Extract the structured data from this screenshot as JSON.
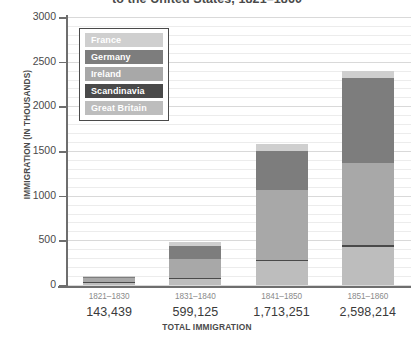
{
  "chart_data": {
    "type": "bar",
    "stacked": true,
    "title": "to the United States, 1821–1860",
    "xlabel": "TOTAL IMMIGRATION",
    "ylabel": "IMMIGRATION (IN THOUSANDS)",
    "ylim": [
      0,
      3000
    ],
    "yticks": [
      0,
      500,
      1000,
      1500,
      2000,
      2500,
      3000
    ],
    "ytick_labels": [
      "0",
      "500",
      "1000",
      "1500",
      "2000",
      "2500",
      "3000"
    ],
    "grid": true,
    "minor_grid": true,
    "legend_position": "inside-upper-left",
    "categories": [
      "1821–1830",
      "1831–1840",
      "1841–1850",
      "1851–1860"
    ],
    "category_totals_label": [
      "143,439",
      "599,125",
      "1,713,251",
      "2,598,214"
    ],
    "totals": [
      143,
      599,
      1713,
      2598
    ],
    "series": [
      {
        "name": "Great Britain",
        "color": "#bdbdbd",
        "values": [
          27,
          76,
          267,
          424
        ]
      },
      {
        "name": "Scandinavia",
        "color": "#4a4a4a",
        "values": [
          3,
          6,
          14,
          25
        ]
      },
      {
        "name": "Ireland",
        "color": "#a8a8a8",
        "values": [
          51,
          207,
          781,
          914
        ]
      },
      {
        "name": "Germany",
        "color": "#7d7d7d",
        "values": [
          7,
          152,
          435,
          952
        ]
      },
      {
        "name": "France",
        "color": "#cfcfcf",
        "values": [
          8,
          45,
          77,
          76
        ]
      }
    ],
    "stack_order_bottom_to_top": [
      "Great Britain",
      "Scandinavia",
      "Ireland",
      "Germany",
      "France"
    ],
    "legend_items": [
      {
        "label": "France",
        "color": "#cfcfcf"
      },
      {
        "label": "Germany",
        "color": "#7d7d7d"
      },
      {
        "label": "Ireland",
        "color": "#a8a8a8"
      },
      {
        "label": "Scandinavia",
        "color": "#4a4a4a"
      },
      {
        "label": "Great Britain",
        "color": "#bdbdbd"
      }
    ]
  }
}
